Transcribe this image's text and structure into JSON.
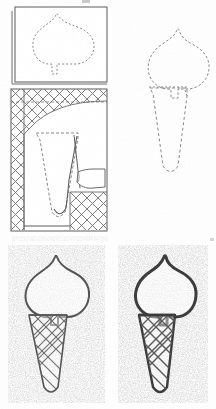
{
  "figure": {
    "kind": "instructional-line-drawing",
    "medium": "scanned black-and-white book illustration",
    "panel_count": 4,
    "background_color": "#fefefe",
    "ink_color": "#4a4a4a",
    "dark_ink_color": "#3a3a3a",
    "light_ink_color": "#8d8d8d",
    "stipple_color": "#a8a8a8",
    "canvas": {
      "width": 216,
      "height": 409
    }
  },
  "panels": [
    {
      "id": "panel-1",
      "name": "template-box-scoop",
      "label": "Step 1 — dashed scoop outline inside bordered card",
      "position": {
        "x": 10,
        "y": 5,
        "width": 98,
        "height": 80
      },
      "border": {
        "style": "double-line-with-offset-shadow",
        "color": "#5c5c5c",
        "width": 1
      },
      "fill": "#ffffff",
      "contents": [
        {
          "name": "dashed-scoop-outline",
          "stroke": "#8a8a8a",
          "dash": "2,2",
          "fill": "none"
        }
      ]
    },
    {
      "id": "panel-2",
      "name": "crosshatch-stencil-layout",
      "label": "Step 2 — crosshatched stencil sheet with peeling flap and dashed cone",
      "position": {
        "x": 10,
        "y": 88,
        "width": 98,
        "height": 143
      },
      "border": {
        "style": "single-line",
        "color": "#5c5c5c",
        "width": 1
      },
      "fill": "#ffffff",
      "contents": [
        {
          "name": "crosshatch-left-strip",
          "stroke": "#707070"
        },
        {
          "name": "crosshatch-top-band",
          "stroke": "#707070"
        },
        {
          "name": "crosshatch-bottom-right-block",
          "stroke": "#707070"
        },
        {
          "name": "dashed-cone-outline",
          "stroke": "#8a8a8a",
          "dash": "3,2"
        },
        {
          "name": "solid-cone-edge",
          "stroke": "#5c5c5c"
        },
        {
          "name": "peeling-flap-curl",
          "stroke": "#6a6a6a",
          "fill": "#ffffff"
        }
      ]
    },
    {
      "id": "panel-3",
      "name": "dashed-full-cone-template",
      "label": "Step 3 — complete dashed cone template, unframed",
      "position": {
        "x": 133,
        "y": 26,
        "width": 78,
        "height": 165
      },
      "border": {
        "style": "none"
      },
      "fill": "none",
      "contents": [
        {
          "name": "dashed-scoop-outline",
          "stroke": "#8a8a8a",
          "dash": "2.5,2"
        },
        {
          "name": "dashed-cone-body-outline",
          "stroke": "#8a8a8a",
          "dash": "3,2.5"
        },
        {
          "name": "dashed-scoop-cone-joint-line",
          "stroke": "#8a8a8a",
          "dash": "2,2"
        }
      ]
    },
    {
      "id": "panel-4",
      "name": "finished-cone-light",
      "label": "Step 4a — finished cone, light outline, stippled ground",
      "position": {
        "x": 8,
        "y": 245,
        "width": 97,
        "height": 158
      },
      "border": {
        "style": "none"
      },
      "fill": "stipple",
      "contents": [
        {
          "name": "stipple-background",
          "color": "#a8a8a8"
        },
        {
          "name": "scoop-outline",
          "stroke": "#555555",
          "width": 2
        },
        {
          "name": "cone-outline",
          "stroke": "#555555",
          "width": 1.6
        },
        {
          "name": "waffle-crosshatch",
          "stroke": "#6e6e6e",
          "width": 1.1
        }
      ]
    },
    {
      "id": "panel-5",
      "name": "finished-cone-bold",
      "label": "Step 4b — finished cone, bold outline, stippled ground",
      "position": {
        "x": 118,
        "y": 245,
        "width": 90,
        "height": 158
      },
      "border": {
        "style": "none"
      },
      "fill": "stipple",
      "contents": [
        {
          "name": "stipple-background",
          "color": "#a8a8a8"
        },
        {
          "name": "scoop-outline",
          "stroke": "#3c3c3c",
          "width": 3
        },
        {
          "name": "cone-outline",
          "stroke": "#3c3c3c",
          "width": 2.4
        },
        {
          "name": "waffle-crosshatch",
          "stroke": "#5a5a5a",
          "width": 1.3
        }
      ]
    }
  ],
  "artifacts": [
    {
      "name": "top-edge-scan-smudge",
      "x": 82,
      "y": 0,
      "width": 8,
      "height": 3
    },
    {
      "name": "lower-middle-scan-streak",
      "x": 12,
      "y": 236,
      "width": 96,
      "height": 5
    },
    {
      "name": "right-margin-speck",
      "x": 210,
      "y": 238,
      "width": 4,
      "height": 3
    }
  ]
}
